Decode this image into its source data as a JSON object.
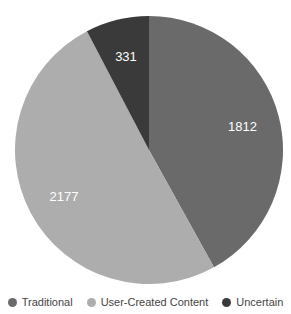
{
  "chart_data": {
    "type": "pie",
    "title": "",
    "categories": [
      "Traditional",
      "User-Created Content",
      "Uncertain"
    ],
    "values": [
      1812,
      2177,
      331
    ],
    "colors": [
      "#6a6a6a",
      "#adadad",
      "#3a3a3a"
    ],
    "legend_position": "bottom",
    "start_angle_deg": 0,
    "direction": "clockwise"
  },
  "legend": {
    "items": [
      {
        "label": "Traditional",
        "color": "#6a6a6a"
      },
      {
        "label": "User-Created Content",
        "color": "#adadad"
      },
      {
        "label": "Uncertain",
        "color": "#3a3a3a"
      }
    ]
  },
  "labels": [
    "1812",
    "2177",
    "331"
  ]
}
